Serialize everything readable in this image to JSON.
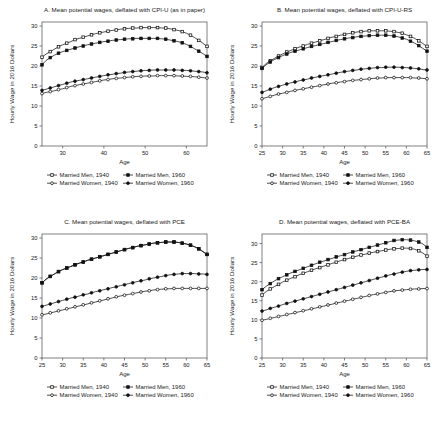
{
  "figure": {
    "ylabel": "Hourly Wage in 2016 Dollars",
    "xlabel": "Age",
    "legend": [
      {
        "label": "Married Men, 1940",
        "marker": "open-square",
        "series": "men_1940"
      },
      {
        "label": "Married Men, 1960",
        "marker": "filled-square",
        "series": "men_1960"
      },
      {
        "label": "Married Women, 1940",
        "marker": "open-circle",
        "series": "women_1940"
      },
      {
        "label": "Married Women, 1960",
        "marker": "filled-circle",
        "series": "women_1960"
      }
    ]
  },
  "chart_data": [
    {
      "panel": "A",
      "type": "line",
      "title": "A. Mean potential wages, deflated with CPI-U (as in paper)",
      "xlabel": "Age",
      "ylabel": "Hourly Wage in 2016 Dollars",
      "xlim": [
        25,
        65
      ],
      "ylim": [
        0,
        31
      ],
      "xticks": [
        30,
        40,
        50,
        60
      ],
      "yticks": [
        0,
        5,
        10,
        15,
        20,
        25,
        30
      ],
      "grid": false,
      "legend_position": "below",
      "x": [
        25,
        26,
        27,
        28,
        29,
        30,
        31,
        32,
        33,
        34,
        35,
        36,
        37,
        38,
        39,
        40,
        41,
        42,
        43,
        44,
        45,
        46,
        47,
        48,
        49,
        50,
        51,
        52,
        53,
        54,
        55,
        56,
        57,
        58,
        59,
        60,
        61,
        62,
        63,
        64,
        65
      ],
      "series": [
        {
          "name": "Married Men, 1940",
          "marker": "open-square",
          "values": [
            22.2,
            23.0,
            23.6,
            24.2,
            24.8,
            25.3,
            25.7,
            26.1,
            26.6,
            26.9,
            27.2,
            27.5,
            27.8,
            28.1,
            28.3,
            28.5,
            28.7,
            28.9,
            29.0,
            29.2,
            29.3,
            29.4,
            29.5,
            29.5,
            29.6,
            29.6,
            29.6,
            29.6,
            29.6,
            29.5,
            29.5,
            29.3,
            29.1,
            28.9,
            28.6,
            28.2,
            27.7,
            27.1,
            26.4,
            25.7,
            24.9
          ]
        },
        {
          "name": "Married Men, 1960",
          "marker": "filled-square",
          "values": [
            20.3,
            21.4,
            22.1,
            22.7,
            23.2,
            23.6,
            23.9,
            24.2,
            24.5,
            24.8,
            25.0,
            25.3,
            25.5,
            25.7,
            25.9,
            26.1,
            26.2,
            26.4,
            26.5,
            26.6,
            26.7,
            26.8,
            26.8,
            26.9,
            26.9,
            26.9,
            26.9,
            26.9,
            26.9,
            26.8,
            26.7,
            26.5,
            26.3,
            26.1,
            25.8,
            25.4,
            24.9,
            24.3,
            23.7,
            23.1,
            22.4
          ]
        },
        {
          "name": "Married Women, 1940",
          "marker": "open-circle",
          "values": [
            13.1,
            13.4,
            13.6,
            13.8,
            14.1,
            14.3,
            14.6,
            14.9,
            15.1,
            15.3,
            15.5,
            15.7,
            15.9,
            16.1,
            16.3,
            16.5,
            16.6,
            16.8,
            16.9,
            17.0,
            17.1,
            17.2,
            17.3,
            17.4,
            17.4,
            17.5,
            17.5,
            17.5,
            17.6,
            17.6,
            17.6,
            17.6,
            17.6,
            17.5,
            17.5,
            17.4,
            17.4,
            17.3,
            17.2,
            17.1,
            17.0
          ]
        },
        {
          "name": "Married Women, 1960",
          "marker": "filled-circle",
          "values": [
            13.9,
            14.2,
            14.5,
            14.8,
            15.1,
            15.4,
            15.7,
            16.0,
            16.2,
            16.4,
            16.6,
            16.8,
            17.0,
            17.2,
            17.4,
            17.6,
            17.8,
            17.9,
            18.1,
            18.2,
            18.4,
            18.5,
            18.6,
            18.7,
            18.8,
            18.9,
            18.9,
            19.0,
            19.0,
            19.0,
            19.0,
            19.0,
            19.0,
            19.0,
            18.9,
            18.9,
            18.8,
            18.7,
            18.6,
            18.5,
            18.3
          ]
        }
      ]
    },
    {
      "panel": "B",
      "type": "line",
      "title": "B. Mean potential wages, deflated with CPI-U-RS",
      "xlabel": "Age",
      "ylabel": "Hourly Wage in 2016 Dollars",
      "xlim": [
        25,
        65
      ],
      "ylim": [
        0,
        31
      ],
      "xticks": [
        25,
        30,
        35,
        40,
        45,
        50,
        55,
        60,
        65
      ],
      "yticks": [
        0,
        5,
        10,
        15,
        20,
        25,
        30
      ],
      "grid": false,
      "legend_position": "below",
      "x": [
        25,
        26,
        27,
        28,
        29,
        30,
        31,
        32,
        33,
        34,
        35,
        36,
        37,
        38,
        39,
        40,
        41,
        42,
        43,
        44,
        45,
        46,
        47,
        48,
        49,
        50,
        51,
        52,
        53,
        54,
        55,
        56,
        57,
        58,
        59,
        60,
        61,
        62,
        63,
        64,
        65
      ],
      "series": [
        {
          "name": "Married Men, 1940",
          "marker": "open-square",
          "values": [
            19.6,
            20.6,
            21.3,
            21.9,
            22.5,
            23.0,
            23.5,
            23.9,
            24.3,
            24.7,
            25.0,
            25.4,
            25.7,
            26.0,
            26.3,
            26.6,
            26.9,
            27.2,
            27.4,
            27.7,
            27.9,
            28.1,
            28.3,
            28.5,
            28.6,
            28.7,
            28.8,
            28.8,
            28.8,
            28.8,
            28.8,
            28.7,
            28.6,
            28.4,
            28.2,
            27.8,
            27.4,
            26.9,
            26.3,
            25.6,
            24.9
          ]
        },
        {
          "name": "Married Men, 1960",
          "marker": "filled-square",
          "values": [
            19.4,
            20.3,
            21.0,
            21.6,
            22.1,
            22.6,
            23.0,
            23.4,
            23.7,
            24.0,
            24.3,
            24.6,
            24.9,
            25.1,
            25.4,
            25.6,
            25.9,
            26.1,
            26.4,
            26.6,
            26.8,
            27.0,
            27.1,
            27.3,
            27.4,
            27.5,
            27.6,
            27.6,
            27.7,
            27.7,
            27.7,
            27.6,
            27.5,
            27.3,
            27.0,
            26.7,
            26.2,
            25.7,
            25.1,
            24.4,
            23.7
          ]
        },
        {
          "name": "Married Women, 1940",
          "marker": "open-circle",
          "values": [
            11.8,
            12.1,
            12.4,
            12.7,
            13.0,
            13.2,
            13.4,
            13.7,
            13.9,
            14.1,
            14.3,
            14.5,
            14.7,
            14.9,
            15.1,
            15.3,
            15.5,
            15.7,
            15.8,
            16.0,
            16.1,
            16.3,
            16.4,
            16.5,
            16.6,
            16.7,
            16.8,
            16.9,
            17.0,
            17.0,
            17.1,
            17.1,
            17.1,
            17.1,
            17.1,
            17.1,
            17.1,
            17.0,
            17.0,
            16.9,
            16.8
          ]
        },
        {
          "name": "Married Women, 1960",
          "marker": "filled-circle",
          "values": [
            13.4,
            13.8,
            14.2,
            14.6,
            14.9,
            15.2,
            15.5,
            15.8,
            16.0,
            16.3,
            16.5,
            16.7,
            17.0,
            17.2,
            17.4,
            17.6,
            17.8,
            18.0,
            18.2,
            18.4,
            18.6,
            18.7,
            18.9,
            19.0,
            19.2,
            19.3,
            19.4,
            19.5,
            19.6,
            19.6,
            19.7,
            19.7,
            19.7,
            19.7,
            19.6,
            19.6,
            19.5,
            19.4,
            19.3,
            19.1,
            19.0
          ]
        }
      ]
    },
    {
      "panel": "C",
      "type": "line",
      "title": "C. Mean potential wages, deflated with PCE",
      "xlabel": "Age",
      "ylabel": "Hourly Wage in 2016 Dollars",
      "xlim": [
        25,
        65
      ],
      "ylim": [
        0,
        31
      ],
      "xticks": [
        25,
        30,
        35,
        40,
        45,
        50,
        55,
        60,
        65
      ],
      "yticks": [
        0,
        5,
        10,
        15,
        20,
        25,
        30
      ],
      "grid": false,
      "legend_position": "below",
      "x": [
        25,
        26,
        27,
        28,
        29,
        30,
        31,
        32,
        33,
        34,
        35,
        36,
        37,
        38,
        39,
        40,
        41,
        42,
        43,
        44,
        45,
        46,
        47,
        48,
        49,
        50,
        51,
        52,
        53,
        54,
        55,
        56,
        57,
        58,
        59,
        60,
        61,
        62,
        63,
        64,
        65
      ],
      "series": [
        {
          "name": "Married Men, 1940",
          "marker": "open-square",
          "values": [
            18.8,
            19.7,
            20.4,
            21.0,
            21.6,
            22.1,
            22.5,
            22.9,
            23.3,
            23.7,
            24.0,
            24.4,
            24.7,
            25.0,
            25.3,
            25.6,
            25.9,
            26.2,
            26.5,
            26.8,
            27.1,
            27.4,
            27.6,
            27.9,
            28.1,
            28.3,
            28.5,
            28.7,
            28.8,
            28.9,
            29.0,
            29.0,
            29.0,
            28.9,
            28.7,
            28.5,
            28.2,
            27.8,
            27.3,
            26.6,
            25.9
          ]
        },
        {
          "name": "Married Men, 1960",
          "marker": "filled-square",
          "values": [
            18.8,
            19.7,
            20.4,
            21.0,
            21.6,
            22.1,
            22.5,
            22.9,
            23.3,
            23.7,
            24.0,
            24.4,
            24.7,
            25.0,
            25.3,
            25.6,
            25.9,
            26.2,
            26.5,
            26.8,
            27.1,
            27.4,
            27.6,
            27.9,
            28.1,
            28.3,
            28.5,
            28.7,
            28.8,
            28.9,
            29.0,
            29.0,
            29.0,
            28.9,
            28.7,
            28.5,
            28.2,
            27.8,
            27.3,
            26.6,
            25.9
          ]
        },
        {
          "name": "Married Women, 1940",
          "marker": "open-circle",
          "values": [
            10.8,
            11.0,
            11.3,
            11.5,
            11.8,
            12.0,
            12.3,
            12.5,
            12.8,
            13.0,
            13.3,
            13.5,
            13.8,
            14.0,
            14.3,
            14.5,
            14.8,
            15.0,
            15.3,
            15.5,
            15.7,
            15.9,
            16.1,
            16.3,
            16.5,
            16.7,
            16.8,
            17.0,
            17.1,
            17.2,
            17.3,
            17.3,
            17.4,
            17.4,
            17.4,
            17.4,
            17.4,
            17.4,
            17.4,
            17.4,
            17.4
          ]
        },
        {
          "name": "Married Women, 1960",
          "marker": "filled-circle",
          "values": [
            12.9,
            13.2,
            13.5,
            13.8,
            14.1,
            14.4,
            14.7,
            15.0,
            15.2,
            15.5,
            15.8,
            16.0,
            16.3,
            16.6,
            16.8,
            17.1,
            17.3,
            17.6,
            17.8,
            18.1,
            18.3,
            18.6,
            18.8,
            19.1,
            19.3,
            19.5,
            19.8,
            20.0,
            20.2,
            20.4,
            20.6,
            20.8,
            20.9,
            21.0,
            21.1,
            21.1,
            21.1,
            21.1,
            21.0,
            21.0,
            20.9
          ]
        }
      ]
    },
    {
      "panel": "D",
      "type": "line",
      "title": "D. Mean potential wages, deflated with PCE-BA",
      "xlabel": "Age",
      "ylabel": "Hourly Wage in 2016 Dollars",
      "xlim": [
        25,
        65
      ],
      "ylim": [
        0,
        32.5
      ],
      "xticks": [
        25,
        30,
        35,
        40,
        45,
        50,
        55,
        60,
        65
      ],
      "yticks": [
        0,
        5,
        10,
        15,
        20,
        25,
        30
      ],
      "grid": false,
      "legend_position": "below",
      "x": [
        25,
        26,
        27,
        28,
        29,
        30,
        31,
        32,
        33,
        34,
        35,
        36,
        37,
        38,
        39,
        40,
        41,
        42,
        43,
        44,
        45,
        46,
        47,
        48,
        49,
        50,
        51,
        52,
        53,
        54,
        55,
        56,
        57,
        58,
        59,
        60,
        61,
        62,
        63,
        64,
        65
      ],
      "series": [
        {
          "name": "Married Men, 1940",
          "marker": "open-square",
          "values": [
            16.5,
            17.4,
            18.1,
            18.7,
            19.3,
            19.9,
            20.4,
            20.9,
            21.3,
            21.8,
            22.2,
            22.6,
            23.0,
            23.4,
            23.7,
            24.1,
            24.4,
            24.8,
            25.1,
            25.5,
            25.8,
            26.1,
            26.4,
            26.7,
            27.0,
            27.2,
            27.5,
            27.7,
            27.9,
            28.1,
            28.3,
            28.5,
            28.6,
            28.7,
            28.8,
            28.8,
            28.7,
            28.5,
            28.1,
            27.5,
            26.7
          ]
        },
        {
          "name": "Married Men, 1960",
          "marker": "filled-square",
          "values": [
            17.9,
            18.8,
            19.5,
            20.2,
            20.8,
            21.3,
            21.8,
            22.3,
            22.7,
            23.1,
            23.5,
            23.9,
            24.3,
            24.7,
            25.1,
            25.4,
            25.8,
            26.1,
            26.5,
            26.8,
            27.1,
            27.5,
            27.8,
            28.1,
            28.4,
            28.7,
            29.0,
            29.3,
            29.6,
            29.9,
            30.2,
            30.5,
            30.8,
            30.9,
            31.0,
            31.0,
            30.9,
            30.7,
            30.4,
            29.9,
            29.0
          ]
        },
        {
          "name": "Married Women, 1940",
          "marker": "open-circle",
          "values": [
            9.9,
            10.1,
            10.4,
            10.6,
            10.9,
            11.1,
            11.4,
            11.6,
            11.9,
            12.1,
            12.4,
            12.6,
            12.9,
            13.1,
            13.4,
            13.6,
            13.9,
            14.1,
            14.4,
            14.6,
            14.9,
            15.1,
            15.4,
            15.6,
            15.9,
            16.1,
            16.4,
            16.6,
            16.8,
            17.0,
            17.2,
            17.4,
            17.6,
            17.7,
            17.8,
            17.9,
            18.0,
            18.1,
            18.1,
            18.2,
            18.2
          ]
        },
        {
          "name": "Married Women, 1960",
          "marker": "filled-circle",
          "values": [
            12.3,
            12.6,
            13.0,
            13.3,
            13.6,
            14.0,
            14.3,
            14.6,
            14.9,
            15.2,
            15.5,
            15.8,
            16.1,
            16.4,
            16.7,
            17.0,
            17.3,
            17.6,
            17.9,
            18.2,
            18.5,
            18.8,
            19.1,
            19.4,
            19.7,
            20.0,
            20.3,
            20.6,
            20.9,
            21.2,
            21.5,
            21.8,
            22.0,
            22.3,
            22.5,
            22.7,
            22.9,
            23.0,
            23.1,
            23.2,
            23.2
          ]
        }
      ]
    }
  ]
}
